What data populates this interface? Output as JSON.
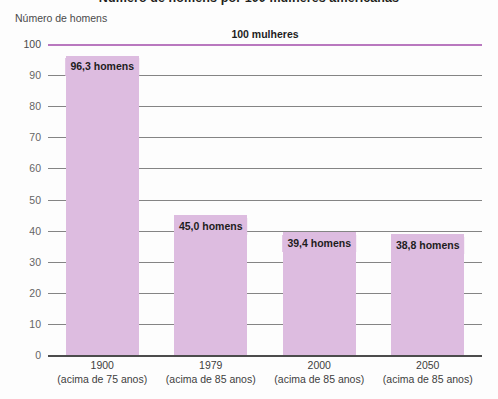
{
  "chart_data": {
    "type": "bar",
    "title": "Número de homens por 100 mulheres americanas",
    "subtitle": "",
    "xlabel": "",
    "ylabel": "Número de homens",
    "ylim": [
      0,
      100
    ],
    "yticks": [
      100,
      90,
      80,
      70,
      60,
      50,
      40,
      30,
      20,
      10,
      0
    ],
    "ytick_labels": [
      "100",
      "90",
      "80",
      "70",
      "60",
      "50",
      "40",
      "30",
      "20",
      "10",
      "0"
    ],
    "grid": true,
    "legend": "none",
    "categories": [
      "1900",
      "1979",
      "2000",
      "2050"
    ],
    "category_sublabels": [
      "(acima de 75 anos)",
      "(acima de 85 anos)",
      "(acima de 85 anos)",
      "(acima de 85 anos)"
    ],
    "values": [
      96.3,
      45.0,
      39.4,
      38.8
    ],
    "data_labels": [
      "96,3 homens",
      "45,0 homens",
      "39,4 homens",
      "38,8 homens"
    ],
    "reference_line": {
      "value": 100,
      "label": "100 mulheres",
      "color": "#b978bf"
    },
    "bar_color": "#ddbce0",
    "gridline_color": "#6f6f6f",
    "axis_color": "#2e2e2e"
  }
}
